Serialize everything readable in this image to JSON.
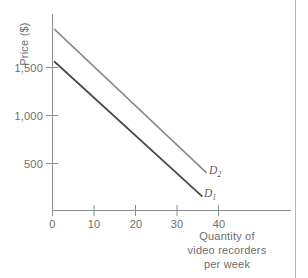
{
  "chart_data": {
    "type": "line",
    "title": "",
    "xlabel": "Quantity of video recorders per week",
    "xlabel_lines": [
      "Quantity of",
      "video recorders",
      "per week"
    ],
    "ylabel": "Price ($)",
    "xlim": [
      0,
      44
    ],
    "ylim": [
      0,
      2050
    ],
    "xticks": [
      0,
      10,
      20,
      30,
      40
    ],
    "xtick_labels": [
      "0",
      "10",
      "20",
      "30",
      "40"
    ],
    "yticks": [
      500,
      1000,
      1500
    ],
    "ytick_labels": [
      "500",
      "1,000",
      "1,500"
    ],
    "grid": false,
    "legend_position": "inline-end-of-line",
    "series": [
      {
        "name": "D1",
        "label": "D",
        "subscript": "1",
        "color": "#4a4a4a",
        "x": [
          0.5,
          36
        ],
        "y": [
          1560,
          150
        ],
        "points": [
          {
            "x": 0.5,
            "y": 1560
          },
          {
            "x": 36,
            "y": 150
          }
        ]
      },
      {
        "name": "D2",
        "label": "D",
        "subscript": "2",
        "color": "#8a8a8a",
        "x": [
          0.5,
          37
        ],
        "y": [
          1900,
          400
        ],
        "points": [
          {
            "x": 0.5,
            "y": 1900
          },
          {
            "x": 37,
            "y": 400
          }
        ]
      }
    ]
  },
  "axis": {
    "color": "#8d8d8d",
    "tick_color": "#8d8d8d"
  }
}
